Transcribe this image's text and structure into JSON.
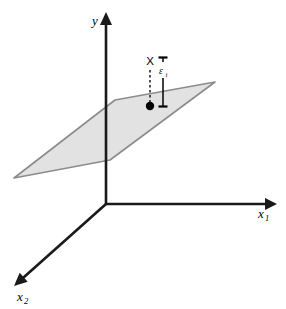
{
  "figure": {
    "background_color": "#ffffff"
  },
  "chart_data": {
    "type": "scatter",
    "title": "",
    "xlabel": "x_1",
    "ylabel": "y",
    "zlabel": "x_2",
    "grid": false,
    "legend": null,
    "axes": [
      {
        "name": "y",
        "label": "y",
        "label_text": "y",
        "direction": "up",
        "from": [
          106,
          204
        ],
        "to": [
          106,
          12
        ],
        "label_pos": [
          95,
          24
        ],
        "arrow": true
      },
      {
        "name": "x1",
        "label": "x_1",
        "label_text": "x",
        "label_subscript": "1",
        "direction": "right",
        "from": [
          106,
          204
        ],
        "to": [
          277,
          204
        ],
        "label_pos": [
          258,
          218
        ],
        "arrow": true
      },
      {
        "name": "x2",
        "label": "x_2",
        "label_text": "x",
        "label_subscript": "2",
        "direction": "down-left",
        "from": [
          106,
          204
        ],
        "to": [
          14,
          286
        ],
        "label_pos": [
          18,
          301
        ],
        "arrow": true
      }
    ],
    "plane": {
      "name": "regression-plane",
      "fill": "#e2e2e2",
      "stroke": "#8c8c8c",
      "opacity": 1,
      "vertices": [
        [
          14,
          178
        ],
        [
          115,
          100
        ],
        [
          215,
          82
        ],
        [
          110,
          160
        ]
      ]
    },
    "points": [
      {
        "name": "observation",
        "label": "X",
        "x": 150,
        "y": 106,
        "marker": "filled-circle",
        "radius": 4.2,
        "color": "#000000",
        "label_pos": [
          144,
          64
        ],
        "dashed_connector": {
          "from": [
            150,
            70
          ],
          "to": [
            150,
            104
          ],
          "dash": "2.5 2.5"
        }
      }
    ],
    "annotations": [
      {
        "name": "residual",
        "label": "ε",
        "label_subscript": "i",
        "label_pos": [
          159,
          73
        ],
        "x": 163,
        "top_y": 57,
        "bottom_y": 107,
        "cap_half_width": 4.5,
        "gap_top": 62,
        "gap_bottom": 78,
        "color": "#000000"
      }
    ],
    "axis_color": "#1a1a1a",
    "axis_width": 2.6
  }
}
